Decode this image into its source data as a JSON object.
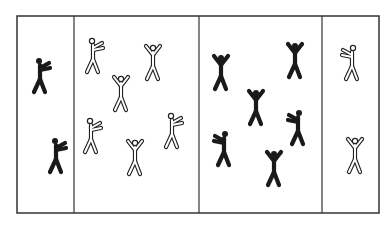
{
  "diagram": {
    "court": {
      "x": 17,
      "y": 16,
      "width": 362,
      "height": 197,
      "stroke": "#333333"
    },
    "dividers_x": [
      74,
      199,
      322
    ],
    "colors": {
      "dark_team": "#1a1a1a",
      "light_team_outline": "#222222",
      "light_team_fill": "#ffffff"
    },
    "zones": [
      {
        "name": "zone-1-dark-jail",
        "team": "dark",
        "count": 2
      },
      {
        "name": "zone-2-light-court",
        "team": "light",
        "count": 7
      },
      {
        "name": "zone-3-dark-court",
        "team": "dark",
        "count": 7
      },
      {
        "name": "zone-4-light-jail",
        "team": "light",
        "count": 2
      }
    ],
    "figures": [
      {
        "zone": 1,
        "team": "dark",
        "x": 40,
        "y": 75,
        "pose": "throw-right"
      },
      {
        "zone": 1,
        "team": "dark",
        "x": 56,
        "y": 155,
        "pose": "throw-right"
      },
      {
        "zone": 2,
        "team": "light",
        "x": 93,
        "y": 55,
        "pose": "throw-right"
      },
      {
        "zone": 2,
        "team": "light",
        "x": 153,
        "y": 62,
        "pose": "arms-up"
      },
      {
        "zone": 2,
        "team": "light",
        "x": 121,
        "y": 93,
        "pose": "arms-up"
      },
      {
        "zone": 2,
        "team": "light",
        "x": 91,
        "y": 135,
        "pose": "throw-right"
      },
      {
        "zone": 2,
        "team": "light",
        "x": 172,
        "y": 130,
        "pose": "throw-right"
      },
      {
        "zone": 2,
        "team": "light",
        "x": 135,
        "y": 157,
        "pose": "arms-up"
      },
      {
        "zone": 3,
        "team": "dark",
        "x": 221,
        "y": 72,
        "pose": "arms-up"
      },
      {
        "zone": 3,
        "team": "dark",
        "x": 295,
        "y": 60,
        "pose": "arms-up"
      },
      {
        "zone": 3,
        "team": "dark",
        "x": 256,
        "y": 107,
        "pose": "arms-up"
      },
      {
        "zone": 3,
        "team": "dark",
        "x": 298,
        "y": 127,
        "pose": "throw-left"
      },
      {
        "zone": 3,
        "team": "dark",
        "x": 224,
        "y": 148,
        "pose": "throw-left"
      },
      {
        "zone": 3,
        "team": "dark",
        "x": 274,
        "y": 168,
        "pose": "arms-up"
      },
      {
        "zone": 4,
        "team": "light",
        "x": 352,
        "y": 62,
        "pose": "throw-left"
      },
      {
        "zone": 4,
        "team": "light",
        "x": 355,
        "y": 155,
        "pose": "arms-up"
      }
    ]
  }
}
